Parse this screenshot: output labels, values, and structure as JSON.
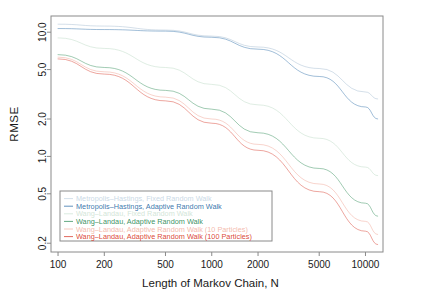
{
  "chart_data": {
    "type": "line",
    "title": "",
    "xlabel": "Length of Markov Chain, N",
    "ylabel": "RMSE",
    "xscale": "log",
    "yscale": "log",
    "xlim": [
      90,
      13000
    ],
    "ylim": [
      0.17,
      13.5
    ],
    "xticks": [
      100,
      200,
      500,
      1000,
      2000,
      5000,
      10000
    ],
    "xtick_labels": [
      "100",
      "200",
      "500",
      "1000",
      "2000",
      "5000",
      "10000"
    ],
    "yticks": [
      0.2,
      0.5,
      1.0,
      2.0,
      5.0,
      10.0
    ],
    "ytick_labels": [
      "0.2",
      "0.5",
      "1.0",
      "2.0",
      "5.0",
      "10.0"
    ],
    "grid": false,
    "legend_position": "bottom-left",
    "x": [
      100,
      200,
      500,
      1000,
      2000,
      5000,
      10000,
      12000
    ],
    "series": [
      {
        "name": "Metropolis-Hastings, Fixed Random Walk",
        "color": "#9fb8cf",
        "values": [
          11.6,
          11.2,
          10.4,
          9.3,
          7.6,
          5.1,
          3.3,
          2.9
        ]
      },
      {
        "name": "Metropolis-Hastings, Adaptive Random Walk",
        "color": "#2f6fa8",
        "values": [
          10.7,
          10.5,
          10.2,
          9.1,
          7.3,
          4.4,
          2.5,
          2.0
        ]
      },
      {
        "name": "Wang-Landau, Fixed Random Walk",
        "color": "#b9d8c2",
        "values": [
          9.0,
          7.4,
          5.2,
          3.8,
          2.6,
          1.4,
          0.82,
          0.7
        ]
      },
      {
        "name": "Wang-Landau, Adaptive Random Walk",
        "color": "#2e8b57",
        "values": [
          6.6,
          5.2,
          3.4,
          2.4,
          1.55,
          0.8,
          0.42,
          0.33
        ]
      },
      {
        "name": "Wang-Landau, Adaptive Random Walk (10 Particles)",
        "color": "#f0a090",
        "values": [
          6.3,
          4.8,
          3.0,
          2.0,
          1.25,
          0.6,
          0.3,
          0.235
        ]
      },
      {
        "name": "Wang-Landau, Adaptive Random Walk (100 Particles)",
        "color": "#d83a2a",
        "values": [
          6.1,
          4.6,
          2.8,
          1.85,
          1.12,
          0.52,
          0.25,
          0.195
        ]
      }
    ]
  },
  "axes": {
    "frame_color": "#8a8a8a"
  },
  "legend": {
    "border_color": "#8a8a8a",
    "entries": [
      {
        "label": "Metropolis–Hastings, Fixed Random Walk",
        "color": "#c6d6e4"
      },
      {
        "label": "Metropolis–Hastings, Adaptive Random Walk",
        "color": "#2f6fa8"
      },
      {
        "label": "Wang–Landau, Fixed Random Walk",
        "color": "#cfe4d5"
      },
      {
        "label": "Wang–Landau, Adaptive Random Walk",
        "color": "#2e8b57"
      },
      {
        "label": "Wang–Landau, Adaptive Random Walk (10 Particles)",
        "color": "#f3b6a8"
      },
      {
        "label": "Wang–Landau, Adaptive Random Walk (100 Particles)",
        "color": "#d83a2a"
      }
    ]
  }
}
